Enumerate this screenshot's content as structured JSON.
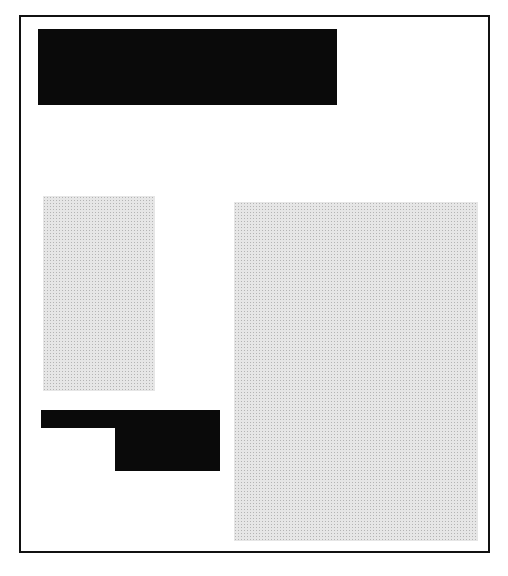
{
  "diagram": {
    "type": "page-layout-wireframe",
    "colors": {
      "frame": "#111111",
      "solid_block": "#0a0a0a",
      "halftone_block": "#e6e6e6",
      "background": "#ffffff"
    },
    "blocks": [
      {
        "id": "headline-bar",
        "fill": "solid",
        "x": 38,
        "y": 29,
        "w": 299,
        "h": 76
      },
      {
        "id": "left-image",
        "fill": "halftone",
        "x": 43,
        "y": 196,
        "w": 112,
        "h": 195
      },
      {
        "id": "l-shape-top",
        "fill": "solid",
        "x": 41,
        "y": 410,
        "w": 179,
        "h": 18
      },
      {
        "id": "l-shape-bottom",
        "fill": "solid",
        "x": 115,
        "y": 410,
        "w": 105,
        "h": 61
      },
      {
        "id": "right-image",
        "fill": "halftone",
        "x": 234,
        "y": 202,
        "w": 244,
        "h": 339
      }
    ]
  }
}
